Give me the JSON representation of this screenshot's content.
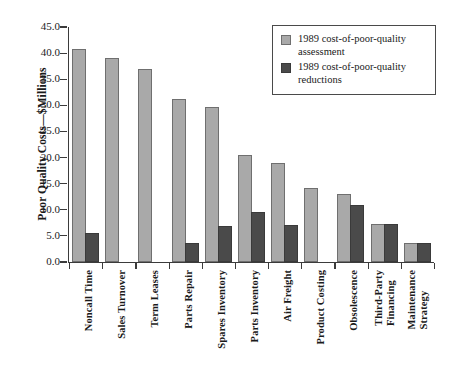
{
  "chart_data": {
    "type": "bar",
    "title": "",
    "xlabel": "",
    "ylabel": "Poor Quality Costs—$Millions",
    "ylim": [
      0.0,
      45.0
    ],
    "ytick_labels": [
      "0.0",
      "5.0",
      "10.0",
      "15.0",
      "20.0",
      "25.0",
      "30.0",
      "35.0",
      "40.0",
      "45.0"
    ],
    "ytick_values": [
      0.0,
      5.0,
      10.0,
      15.0,
      20.0,
      25.0,
      30.0,
      35.0,
      40.0,
      45.0
    ],
    "grid": false,
    "legend_position": "top-right",
    "categories": [
      "Noncall Time",
      "Sales Turnover",
      "Term Leases",
      "Parts Repair",
      "Spares Inventory",
      "Parts Inventory",
      "Air Freight",
      "Product Costing",
      "Obsolescence",
      "Third-Party Financing",
      "Maintenance Strategy"
    ],
    "category_lines": [
      [
        "Noncall Time"
      ],
      [
        "Sales Turnover"
      ],
      [
        "Term Leases"
      ],
      [
        "Parts Repair"
      ],
      [
        "Spares Inventory"
      ],
      [
        "Parts Inventory"
      ],
      [
        "Air Freight"
      ],
      [
        "Product Costing"
      ],
      [
        "Obsolescence"
      ],
      [
        "Third-Party",
        "Financing"
      ],
      [
        "Maintenance",
        "Strategy"
      ]
    ],
    "series": [
      {
        "name": "1989 cost-of-poor-quality assessment",
        "color": "#a9a9a9",
        "values": [
          40.8,
          39.0,
          37.0,
          31.2,
          29.6,
          20.4,
          19.0,
          14.2,
          13.1,
          7.2,
          3.6
        ]
      },
      {
        "name": "1989 cost-of-poor-quality reductions",
        "color": "#4a4a4a",
        "values": [
          5.6,
          0.0,
          0.0,
          3.6,
          6.9,
          9.6,
          7.1,
          0.0,
          11.0,
          7.2,
          3.6
        ]
      }
    ]
  },
  "legend": {
    "items": [
      {
        "label": "1989 cost-of-poor-quality assessment",
        "swatch": "assessment"
      },
      {
        "label": "1989 cost-of-poor-quality reductions",
        "swatch": "reduction"
      }
    ]
  },
  "colors": {
    "assessment": "#a9a9a9",
    "reduction": "#4a4a4a",
    "axis": "#3b3b3b"
  }
}
